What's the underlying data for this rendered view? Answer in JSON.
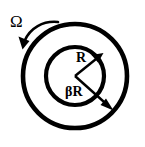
{
  "figure": {
    "name": "concentric-annulus-rotation-diagram",
    "background_color": "#ffffff",
    "stroke_color": "#000000",
    "width": 145,
    "height": 147
  },
  "labels": {
    "angular_velocity": "Ω",
    "outer_radius": "R",
    "inner_radius": "βR"
  },
  "geometry": {
    "center_x": 75,
    "center_y": 76,
    "outer_radius_px": 52,
    "inner_radius_px": 29,
    "circle_stroke_width": 4.6
  },
  "arrows": {
    "rotation": {
      "name": "rotation-arrow",
      "direction": "counterclockwise",
      "start_x": 58,
      "start_y": 22,
      "end_x": 22,
      "end_y": 49
    },
    "outer_radius_arrow": {
      "name": "outer-radius-arrow",
      "from_x": 75,
      "from_y": 76,
      "to_x": 112,
      "to_y": 110
    },
    "inner_radius_arrow": {
      "name": "inner-radius-arrow",
      "from_x": 75,
      "from_y": 76,
      "to_x": 102,
      "to_y": 54
    }
  },
  "label_positions": {
    "omega": {
      "x": 10,
      "y": 27
    },
    "r": {
      "x": 76,
      "y": 62
    },
    "beta_r": {
      "x": 65,
      "y": 96
    }
  }
}
